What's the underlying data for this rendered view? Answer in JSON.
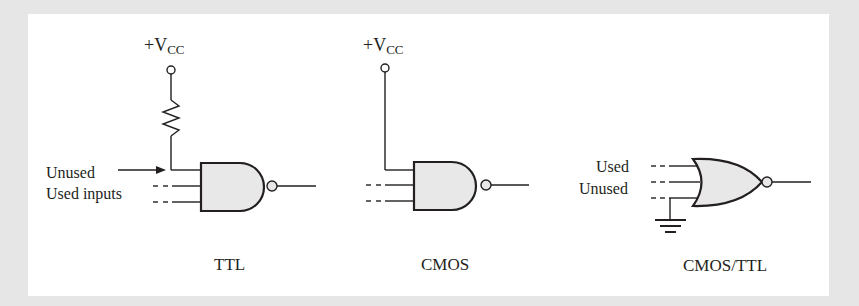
{
  "diagram": {
    "colors": {
      "background": "#e6e6e6",
      "panel": "#ffffff",
      "gate_fill": "#e8e8e8",
      "stroke": "#231f20"
    },
    "circuits": [
      {
        "caption": "TTL",
        "supply_label": "+V",
        "supply_subscript": "CC",
        "gate": "NAND",
        "labels": {
          "unused": "Unused",
          "used": "Used inputs"
        },
        "pullup": "resistor"
      },
      {
        "caption": "CMOS",
        "supply_label": "+V",
        "supply_subscript": "CC",
        "gate": "NAND",
        "pullup": "direct"
      },
      {
        "caption": "CMOS/TTL",
        "gate": "NOR",
        "labels": {
          "used": "Used",
          "unused": "Unused"
        },
        "pulldown": "ground"
      }
    ]
  }
}
